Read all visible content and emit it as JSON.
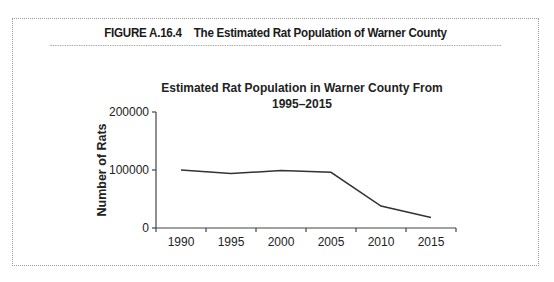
{
  "figure": {
    "number": "FIGURE A.16.4",
    "caption": "The Estimated Rat Population of Warner County"
  },
  "chart": {
    "title_line1": "Estimated Rat Population in Warner County From",
    "title_line2": "1995–2015",
    "ylabel": "Number of Rats",
    "yticks": [
      "200000",
      "100000",
      "0"
    ],
    "xticks": [
      "1990",
      "1995",
      "2000",
      "2005",
      "2010",
      "2015"
    ]
  },
  "chart_data": {
    "type": "line",
    "title": "Estimated Rat Population in Warner County From 1995–2015",
    "xlabel": "",
    "ylabel": "Number of Rats",
    "categories": [
      "1990",
      "1995",
      "2000",
      "2005",
      "2010",
      "2015"
    ],
    "series": [
      {
        "name": "Estimated Rat Population",
        "values": [
          100000,
          94000,
          99000,
          96000,
          38000,
          18000
        ]
      }
    ],
    "ylim": [
      0,
      200000
    ],
    "yticks": [
      0,
      100000,
      200000
    ],
    "grid": false,
    "legend": "none",
    "line_color": "#333333"
  }
}
